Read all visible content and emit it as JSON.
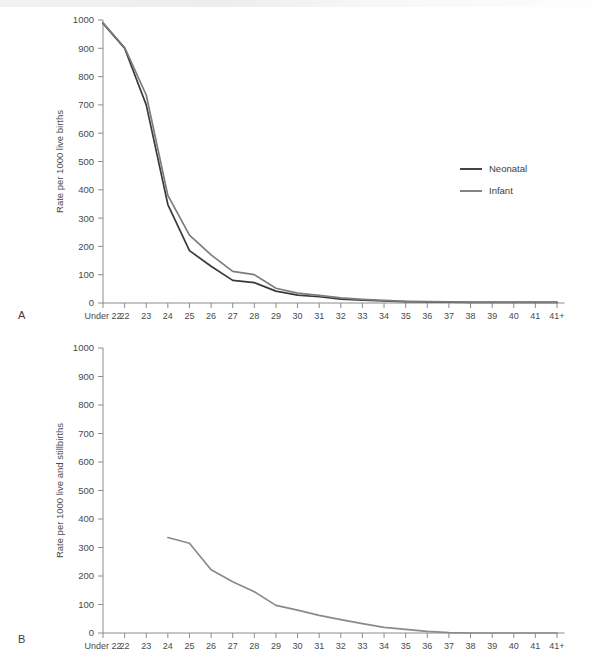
{
  "figure": {
    "panels": [
      {
        "letter": "A"
      },
      {
        "letter": "B"
      }
    ]
  },
  "chart_data": [
    {
      "type": "line",
      "panel": "A",
      "title": "",
      "xlabel": "",
      "ylabel": "Rate per 1000 live births",
      "ylim": [
        0,
        1000
      ],
      "ytick_step": 100,
      "yticks": [
        0,
        100,
        200,
        300,
        400,
        500,
        600,
        700,
        800,
        900,
        1000
      ],
      "ytick_labels": [
        "0",
        "100",
        "200",
        "300",
        "400",
        "500",
        "600",
        "700",
        "800",
        "900",
        "1000"
      ],
      "grid": false,
      "legend_position": "right-upper",
      "categories": [
        "Under 22",
        "22",
        "23",
        "24",
        "25",
        "26",
        "27",
        "28",
        "29",
        "30",
        "31",
        "32",
        "33",
        "34",
        "35",
        "36",
        "37",
        "38",
        "39",
        "40",
        "41",
        "41+"
      ],
      "series": [
        {
          "name": "Neonatal",
          "color": "#3a3a3a",
          "values": [
            988,
            900,
            700,
            348,
            185,
            130,
            80,
            72,
            42,
            28,
            22,
            14,
            10,
            7,
            5,
            4,
            3,
            2,
            2,
            2,
            2,
            2
          ]
        },
        {
          "name": "Infant",
          "color": "#7d7d7d",
          "values": [
            990,
            903,
            735,
            380,
            240,
            170,
            112,
            100,
            52,
            35,
            27,
            18,
            13,
            9,
            6,
            5,
            4,
            3,
            3,
            3,
            3,
            3
          ]
        }
      ]
    },
    {
      "type": "line",
      "panel": "B",
      "title": "",
      "xlabel": "",
      "ylabel": "Rate per 1000 live and stillbirths",
      "ylim": [
        0,
        1000
      ],
      "ytick_step": 100,
      "yticks": [
        0,
        100,
        200,
        300,
        400,
        500,
        600,
        700,
        800,
        900,
        1000
      ],
      "ytick_labels": [
        "0",
        "100",
        "200",
        "300",
        "400",
        "500",
        "600",
        "700",
        "800",
        "900",
        "1000"
      ],
      "grid": false,
      "legend_position": "none",
      "categories": [
        "Under 22",
        "22",
        "23",
        "24",
        "25",
        "26",
        "27",
        "28",
        "29",
        "30",
        "31",
        "32",
        "33",
        "34",
        "35",
        "36",
        "37",
        "38",
        "39",
        "40",
        "41",
        "41+"
      ],
      "series": [
        {
          "name": "Stillbirth and neonatal rate",
          "color": "#8a8a8a",
          "values": [
            null,
            null,
            null,
            335,
            315,
            222,
            180,
            145,
            97,
            80,
            62,
            47,
            33,
            20,
            13,
            6,
            1,
            0,
            0,
            0,
            0,
            0
          ]
        }
      ]
    }
  ]
}
